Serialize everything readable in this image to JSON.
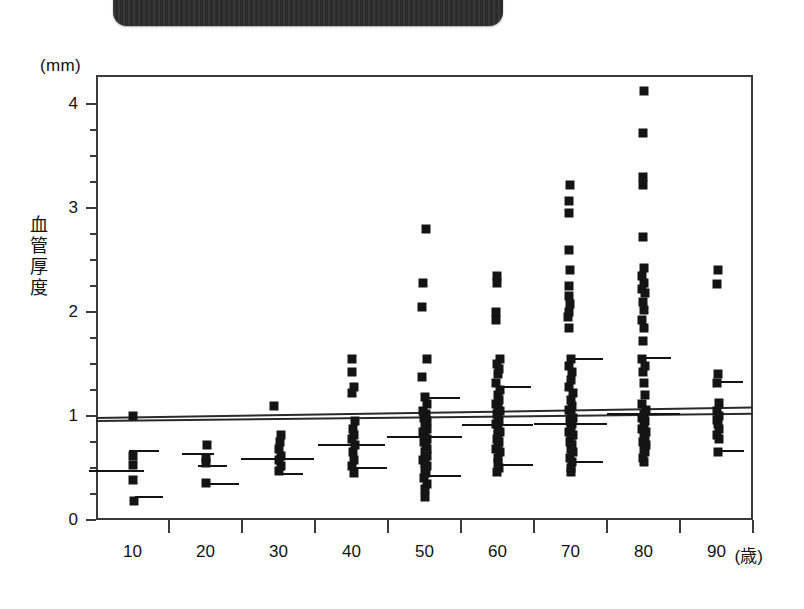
{
  "banner": {
    "text": "",
    "visible": true
  },
  "chart_data": {
    "type": "scatter",
    "title": "",
    "unit_label": "(mm)",
    "ylabel": "血管厚度",
    "ylabel_chars": [
      "血",
      "管",
      "厚",
      "度"
    ],
    "xlabel": "(歳)",
    "xlim": [
      5,
      95
    ],
    "ylim": [
      0,
      4.3
    ],
    "yticks": [
      0,
      1,
      2,
      3,
      4
    ],
    "ytick_labels": [
      "0",
      "1",
      "2",
      "3",
      "4"
    ],
    "yminor_step": 0.25,
    "xticks": [
      10,
      20,
      30,
      40,
      50,
      60,
      70,
      80,
      90
    ],
    "xtick_labels": [
      "10",
      "20",
      "30",
      "40",
      "50",
      "60",
      "70",
      "80",
      "90"
    ],
    "grid": false,
    "legend": null,
    "marker": "square",
    "marker_color": "#141414",
    "series": [
      {
        "name": "10",
        "x": 10,
        "values": [
          1.0,
          0.62,
          0.53,
          0.38,
          0.18
        ],
        "offsets": [
          0,
          0,
          0,
          0,
          0.18
        ],
        "mean_bars": [
          {
            "value": 0.66,
            "x0": -0.5,
            "x1": 3.6
          },
          {
            "value": 0.47,
            "x0": -6.0,
            "x1": 1.6
          },
          {
            "value": 0.22,
            "x0": 0.4,
            "x1": 4.2
          }
        ]
      },
      {
        "name": "20",
        "x": 20,
        "values": [
          0.72,
          0.6,
          0.55,
          0.36
        ],
        "offsets": [
          0.2,
          0.05,
          0,
          0
        ],
        "mean_bars": [
          {
            "value": 0.63,
            "x0": -3.2,
            "x1": 1.2
          },
          {
            "value": 0.52,
            "x0": -1.0,
            "x1": 3.0
          },
          {
            "value": 0.35,
            "x0": 0.2,
            "x1": 4.6
          }
        ]
      },
      {
        "name": "30",
        "x": 30,
        "values": [
          1.1,
          0.82,
          0.75,
          0.68,
          0.62,
          0.58,
          0.52,
          0.47
        ],
        "offsets": [
          -0.6,
          0.4,
          0.25,
          0.0,
          0.35,
          0.1,
          0.3,
          0.0
        ],
        "mean_bars": [
          {
            "value": 0.585,
            "x0": -5.2,
            "x1": 4.8
          },
          {
            "value": 0.44,
            "x0": -0.5,
            "x1": 3.3
          }
        ]
      },
      {
        "name": "40",
        "x": 40,
        "values": [
          1.55,
          1.42,
          1.28,
          1.22,
          0.95,
          0.88,
          0.82,
          0.78,
          0.72,
          0.65,
          0.58,
          0.52,
          0.45
        ],
        "offsets": [
          0.1,
          0.1,
          0.3,
          0.0,
          0.5,
          0.15,
          0.35,
          0.0,
          0.45,
          0.15,
          0.3,
          0.1,
          0.4
        ],
        "mean_bars": [
          {
            "value": 0.72,
            "x0": -4.6,
            "x1": 4.6
          },
          {
            "value": 0.5,
            "x0": 0.1,
            "x1": 4.8
          }
        ]
      },
      {
        "name": "50",
        "x": 50,
        "values": [
          2.8,
          2.28,
          2.05,
          1.55,
          1.38,
          1.18,
          1.12,
          1.05,
          1.02,
          0.98,
          0.95,
          0.92,
          0.88,
          0.85,
          0.82,
          0.78,
          0.75,
          0.72,
          0.68,
          0.65,
          0.62,
          0.58,
          0.55,
          0.52,
          0.48,
          0.45,
          0.4,
          0.35,
          0.3,
          0.22
        ],
        "offsets": [
          0.2,
          -0.2,
          -0.3,
          0.4,
          -0.3,
          0.1,
          0.4,
          -0.2,
          0.2,
          -0.1,
          0.3,
          0.0,
          0.4,
          -0.2,
          0.1,
          0.3,
          -0.1,
          0.2,
          0.4,
          0.0,
          0.3,
          -0.2,
          0.1,
          0.4,
          0.0,
          0.2,
          -0.1,
          0.3,
          0.1,
          0.0
        ],
        "mean_bars": [
          {
            "value": 1.17,
            "x0": 0.2,
            "x1": 4.8
          },
          {
            "value": 0.8,
            "x0": -5.2,
            "x1": 5.2
          },
          {
            "value": 0.42,
            "x0": 0.4,
            "x1": 5.0
          }
        ]
      },
      {
        "name": "60",
        "x": 60,
        "values": [
          2.35,
          2.28,
          2.0,
          1.92,
          1.55,
          1.5,
          1.45,
          1.4,
          1.32,
          1.25,
          1.2,
          1.15,
          1.12,
          1.08,
          1.05,
          1.02,
          0.98,
          0.95,
          0.92,
          0.88,
          0.85,
          0.82,
          0.78,
          0.75,
          0.72,
          0.68,
          0.65,
          0.6,
          0.55,
          0.5,
          0.46
        ],
        "offsets": [
          -0.1,
          -0.1,
          -0.2,
          -0.2,
          0.3,
          -0.1,
          0.2,
          0.0,
          -0.2,
          0.3,
          0.0,
          0.2,
          -0.2,
          0.1,
          0.3,
          -0.1,
          0.0,
          0.2,
          -0.2,
          0.1,
          0.3,
          0.0,
          -0.1,
          0.2,
          0.1,
          -0.2,
          0.3,
          0.0,
          0.1,
          0.2,
          -0.1
        ],
        "mean_bars": [
          {
            "value": 1.28,
            "x0": 0.3,
            "x1": 4.6
          },
          {
            "value": 0.91,
            "x0": -4.8,
            "x1": 4.8
          },
          {
            "value": 0.53,
            "x0": 0.3,
            "x1": 4.8
          }
        ]
      },
      {
        "name": "70",
        "x": 70,
        "values": [
          3.22,
          3.07,
          2.95,
          2.6,
          2.4,
          2.25,
          2.15,
          2.08,
          2.0,
          1.95,
          1.85,
          1.55,
          1.48,
          1.42,
          1.35,
          1.28,
          1.22,
          1.15,
          1.1,
          1.06,
          1.02,
          0.98,
          0.95,
          0.92,
          0.88,
          0.85,
          0.82,
          0.78,
          0.75,
          0.72,
          0.68,
          0.65,
          0.6,
          0.56,
          0.5,
          0.46
        ],
        "offsets": [
          -0.1,
          -0.2,
          -0.2,
          -0.2,
          -0.1,
          -0.2,
          -0.2,
          -0.1,
          -0.2,
          -0.3,
          -0.2,
          0.1,
          -0.2,
          0.2,
          0.0,
          -0.2,
          0.3,
          0.0,
          0.2,
          -0.2,
          0.1,
          0.3,
          -0.1,
          0.2,
          0.0,
          -0.2,
          0.3,
          0.1,
          -0.1,
          0.2,
          0.0,
          0.3,
          -0.1,
          0.2,
          0.1,
          0.0
        ],
        "mean_bars": [
          {
            "value": 1.55,
            "x0": 0.3,
            "x1": 4.4
          },
          {
            "value": 0.92,
            "x0": -5.0,
            "x1": 5.0
          },
          {
            "value": 0.56,
            "x0": 0.3,
            "x1": 4.4
          }
        ]
      },
      {
        "name": "80",
        "x": 80,
        "values": [
          4.13,
          3.72,
          3.3,
          3.22,
          2.72,
          2.42,
          2.35,
          2.28,
          2.22,
          2.18,
          2.1,
          2.02,
          1.92,
          1.85,
          1.72,
          1.55,
          1.48,
          1.42,
          1.32,
          1.2,
          1.12,
          1.06,
          1.02,
          0.98,
          0.95,
          0.92,
          0.88,
          0.85,
          0.82,
          0.78,
          0.75,
          0.72,
          0.68,
          0.65,
          0.6,
          0.56
        ],
        "offsets": [
          0.0,
          -0.1,
          -0.1,
          -0.1,
          -0.1,
          0.0,
          -0.2,
          0.1,
          -0.2,
          0.2,
          -0.1,
          0.0,
          -0.2,
          0.1,
          -0.1,
          -0.2,
          0.2,
          -0.1,
          0.0,
          0.2,
          -0.2,
          0.4,
          0.0,
          -0.2,
          0.2,
          0.1,
          -0.2,
          0.3,
          0.0,
          0.2,
          -0.1,
          0.3,
          0.0,
          0.2,
          -0.1,
          0.1
        ],
        "mean_bars": [
          {
            "value": 1.56,
            "x0": -0.5,
            "x1": 3.8
          },
          {
            "value": 1.02,
            "x0": -5.0,
            "x1": 5.0
          }
        ]
      },
      {
        "name": "90",
        "x": 90,
        "values": [
          2.4,
          2.27,
          1.4,
          1.32,
          1.13,
          1.05,
          1.0,
          0.96,
          0.92,
          0.88,
          0.82,
          0.78,
          0.65
        ],
        "offsets": [
          0.2,
          0.0,
          0.2,
          0.0,
          0.3,
          0.1,
          0.3,
          0.0,
          0.2,
          0.4,
          0.0,
          0.3,
          0.2
        ],
        "mean_bars": [
          {
            "value": 1.33,
            "x0": 0.3,
            "x1": 3.6
          },
          {
            "value": 0.66,
            "x0": 0.3,
            "x1": 3.8
          }
        ]
      }
    ],
    "reference_lines": [
      {
        "name": "regression-upper",
        "x0": 5,
        "y0": 0.99,
        "x1": 95,
        "y1": 1.09
      },
      {
        "name": "regression-lower",
        "x0": 5,
        "y0": 0.96,
        "x1": 95,
        "y1": 1.03
      }
    ]
  }
}
